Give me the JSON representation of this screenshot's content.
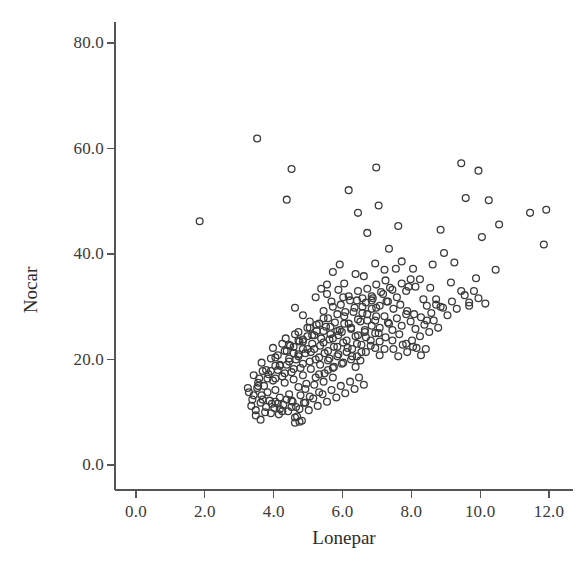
{
  "chart_data": {
    "type": "scatter",
    "title": "",
    "xlabel": "Lonepar",
    "ylabel": "Nocar",
    "xlim": [
      0.0,
      12.7
    ],
    "ylim": [
      0.0,
      84.0
    ],
    "xticks": [
      0.0,
      2.0,
      4.0,
      6.0,
      8.0,
      10.0,
      12.0
    ],
    "xtick_labels": [
      "0.0",
      "2.0",
      "4.0",
      "6.0",
      "8.0",
      "10.0",
      "12.0"
    ],
    "yticks": [
      0.0,
      20.0,
      40.0,
      60.0,
      80.0
    ],
    "ytick_labels": [
      "0.0",
      "20.0",
      "40.0",
      "60.0",
      "80.0"
    ],
    "grid": false,
    "legend": null,
    "marker": {
      "shape": "open-circle",
      "radius_px": 3.4,
      "stroke": "#3b3b3b",
      "stroke_width": 1.3,
      "fill": "none"
    },
    "axis_color": "#555555",
    "background": "#ffffff",
    "n_points": 330,
    "points": [
      [
        1.85,
        46.2
      ],
      [
        3.52,
        61.9
      ],
      [
        4.52,
        56.1
      ],
      [
        4.38,
        50.3
      ],
      [
        6.18,
        52.1
      ],
      [
        6.45,
        47.8
      ],
      [
        6.98,
        56.4
      ],
      [
        6.72,
        44.0
      ],
      [
        7.05,
        49.2
      ],
      [
        7.62,
        45.3
      ],
      [
        7.35,
        41.0
      ],
      [
        9.45,
        57.2
      ],
      [
        9.95,
        55.8
      ],
      [
        9.58,
        50.6
      ],
      [
        10.25,
        50.2
      ],
      [
        11.45,
        47.8
      ],
      [
        11.92,
        48.4
      ],
      [
        11.85,
        41.8
      ],
      [
        10.55,
        45.6
      ],
      [
        10.05,
        43.2
      ],
      [
        8.85,
        44.6
      ],
      [
        8.95,
        40.2
      ],
      [
        9.25,
        38.4
      ],
      [
        8.62,
        38.0
      ],
      [
        9.15,
        34.6
      ],
      [
        9.45,
        33.0
      ],
      [
        10.45,
        37.0
      ],
      [
        9.88,
        35.4
      ],
      [
        10.15,
        30.6
      ],
      [
        9.68,
        30.2
      ],
      [
        8.55,
        33.6
      ],
      [
        8.25,
        35.2
      ],
      [
        8.05,
        37.2
      ],
      [
        7.92,
        33.8
      ],
      [
        8.35,
        31.4
      ],
      [
        8.72,
        30.4
      ],
      [
        7.72,
        38.6
      ],
      [
        7.55,
        37.2
      ],
      [
        7.22,
        37.0
      ],
      [
        6.95,
        38.2
      ],
      [
        6.62,
        35.8
      ],
      [
        6.38,
        36.2
      ],
      [
        6.05,
        34.4
      ],
      [
        5.92,
        38.0
      ],
      [
        5.72,
        36.6
      ],
      [
        5.55,
        34.2
      ],
      [
        5.38,
        33.4
      ],
      [
        5.22,
        31.8
      ],
      [
        6.18,
        32.0
      ],
      [
        6.42,
        31.2
      ],
      [
        6.68,
        30.8
      ],
      [
        6.88,
        31.6
      ],
      [
        7.08,
        30.2
      ],
      [
        7.28,
        31.0
      ],
      [
        7.48,
        29.6
      ],
      [
        7.68,
        30.4
      ],
      [
        7.88,
        29.2
      ],
      [
        8.08,
        28.6
      ],
      [
        8.28,
        28.0
      ],
      [
        8.45,
        27.4
      ],
      [
        4.62,
        29.8
      ],
      [
        4.85,
        28.4
      ],
      [
        5.05,
        27.2
      ],
      [
        5.25,
        26.6
      ],
      [
        5.45,
        27.8
      ],
      [
        5.65,
        26.2
      ],
      [
        5.85,
        25.4
      ],
      [
        6.05,
        26.8
      ],
      [
        6.25,
        25.8
      ],
      [
        6.45,
        24.6
      ],
      [
        6.65,
        25.2
      ],
      [
        6.85,
        26.4
      ],
      [
        7.05,
        25.0
      ],
      [
        7.25,
        24.2
      ],
      [
        7.45,
        23.6
      ],
      [
        7.65,
        24.8
      ],
      [
        7.85,
        23.0
      ],
      [
        8.05,
        22.4
      ],
      [
        3.25,
        14.6
      ],
      [
        3.42,
        13.2
      ],
      [
        3.55,
        15.0
      ],
      [
        3.68,
        12.4
      ],
      [
        3.82,
        13.8
      ],
      [
        3.95,
        11.6
      ],
      [
        4.05,
        14.2
      ],
      [
        4.18,
        12.8
      ],
      [
        4.32,
        15.6
      ],
      [
        4.45,
        13.4
      ],
      [
        4.58,
        16.2
      ],
      [
        4.72,
        14.8
      ],
      [
        4.85,
        17.0
      ],
      [
        4.95,
        15.4
      ],
      [
        5.08,
        18.2
      ],
      [
        5.22,
        16.6
      ],
      [
        5.35,
        19.0
      ],
      [
        5.48,
        17.4
      ],
      [
        5.62,
        20.2
      ],
      [
        5.75,
        18.6
      ],
      [
        5.88,
        21.0
      ],
      [
        6.02,
        19.4
      ],
      [
        6.15,
        22.2
      ],
      [
        6.28,
        20.6
      ],
      [
        6.42,
        23.0
      ],
      [
        6.55,
        21.4
      ],
      [
        6.68,
        24.2
      ],
      [
        6.82,
        22.6
      ],
      [
        6.95,
        25.0
      ],
      [
        7.08,
        23.4
      ],
      [
        3.35,
        11.2
      ],
      [
        3.48,
        10.4
      ],
      [
        3.62,
        11.8
      ],
      [
        3.75,
        10.0
      ],
      [
        3.88,
        12.2
      ],
      [
        4.02,
        10.8
      ],
      [
        4.15,
        9.6
      ],
      [
        4.28,
        11.4
      ],
      [
        4.42,
        10.2
      ],
      [
        4.55,
        12.0
      ],
      [
        4.68,
        9.2
      ],
      [
        4.82,
        8.4
      ],
      [
        4.62,
        8.0
      ],
      [
        4.75,
        10.6
      ],
      [
        4.88,
        11.8
      ],
      [
        5.02,
        10.4
      ],
      [
        5.15,
        12.6
      ],
      [
        5.28,
        11.2
      ],
      [
        5.42,
        13.4
      ],
      [
        5.55,
        12.0
      ],
      [
        5.68,
        14.2
      ],
      [
        5.82,
        12.8
      ],
      [
        5.95,
        15.0
      ],
      [
        6.08,
        13.6
      ],
      [
        6.22,
        15.8
      ],
      [
        6.35,
        14.4
      ],
      [
        6.48,
        16.6
      ],
      [
        6.62,
        15.2
      ],
      [
        3.58,
        16.4
      ],
      [
        3.72,
        15.0
      ],
      [
        3.85,
        17.2
      ],
      [
        3.98,
        16.0
      ],
      [
        4.12,
        18.0
      ],
      [
        4.25,
        16.8
      ],
      [
        4.38,
        19.0
      ],
      [
        4.52,
        17.6
      ],
      [
        4.65,
        20.0
      ],
      [
        4.78,
        18.4
      ],
      [
        4.92,
        21.2
      ],
      [
        5.05,
        19.6
      ],
      [
        5.18,
        22.0
      ],
      [
        5.32,
        20.4
      ],
      [
        5.45,
        23.2
      ],
      [
        5.58,
        21.6
      ],
      [
        5.72,
        24.0
      ],
      [
        5.85,
        22.4
      ],
      [
        5.98,
        25.2
      ],
      [
        6.12,
        23.6
      ],
      [
        6.25,
        26.0
      ],
      [
        6.38,
        24.4
      ],
      [
        6.52,
        27.2
      ],
      [
        6.65,
        25.6
      ],
      [
        4.45,
        22.8
      ],
      [
        4.58,
        21.2
      ],
      [
        4.72,
        23.6
      ],
      [
        4.85,
        22.0
      ],
      [
        4.98,
        24.4
      ],
      [
        5.12,
        23.0
      ],
      [
        5.25,
        25.4
      ],
      [
        5.38,
        24.0
      ],
      [
        5.52,
        26.2
      ],
      [
        5.65,
        24.8
      ],
      [
        5.78,
        27.0
      ],
      [
        5.92,
        25.6
      ],
      [
        6.05,
        28.2
      ],
      [
        6.18,
        26.8
      ],
      [
        6.32,
        29.0
      ],
      [
        6.45,
        27.6
      ],
      [
        6.58,
        30.0
      ],
      [
        6.72,
        28.6
      ],
      [
        6.85,
        31.2
      ],
      [
        6.98,
        29.8
      ],
      [
        4.05,
        20.4
      ],
      [
        4.18,
        19.0
      ],
      [
        4.32,
        21.6
      ],
      [
        4.45,
        20.2
      ],
      [
        4.58,
        22.4
      ],
      [
        4.72,
        21.0
      ],
      [
        4.85,
        23.4
      ],
      [
        4.98,
        22.0
      ],
      [
        3.92,
        17.8
      ],
      [
        4.05,
        16.4
      ],
      [
        4.18,
        18.8
      ],
      [
        4.32,
        17.4
      ],
      [
        4.45,
        19.6
      ],
      [
        4.58,
        18.2
      ],
      [
        4.72,
        20.6
      ],
      [
        4.85,
        19.2
      ],
      [
        5.08,
        21.4
      ],
      [
        5.22,
        20.0
      ],
      [
        5.35,
        22.6
      ],
      [
        5.48,
        21.2
      ],
      [
        5.62,
        23.8
      ],
      [
        5.75,
        22.4
      ],
      [
        5.88,
        24.6
      ],
      [
        6.02,
        23.2
      ],
      [
        7.18,
        32.4
      ],
      [
        7.32,
        31.0
      ],
      [
        7.45,
        33.2
      ],
      [
        7.58,
        31.8
      ],
      [
        7.72,
        34.4
      ],
      [
        7.85,
        33.0
      ],
      [
        7.98,
        35.2
      ],
      [
        8.12,
        33.8
      ],
      [
        6.72,
        33.4
      ],
      [
        6.85,
        32.0
      ],
      [
        6.98,
        34.2
      ],
      [
        7.12,
        32.8
      ],
      [
        7.25,
        35.0
      ],
      [
        7.38,
        33.6
      ],
      [
        6.45,
        33.0
      ],
      [
        6.58,
        31.6
      ],
      [
        5.95,
        30.4
      ],
      [
        6.08,
        29.0
      ],
      [
        6.22,
        31.2
      ],
      [
        6.35,
        29.8
      ],
      [
        5.45,
        29.2
      ],
      [
        5.58,
        27.8
      ],
      [
        5.72,
        30.0
      ],
      [
        5.85,
        28.6
      ],
      [
        5.05,
        26.0
      ],
      [
        5.18,
        24.6
      ],
      [
        5.32,
        26.8
      ],
      [
        5.45,
        25.4
      ],
      [
        4.72,
        25.2
      ],
      [
        4.85,
        23.8
      ],
      [
        4.98,
        26.0
      ],
      [
        5.12,
        24.6
      ],
      [
        4.35,
        24.0
      ],
      [
        4.48,
        22.6
      ],
      [
        4.62,
        24.8
      ],
      [
        4.75,
        23.4
      ],
      [
        3.98,
        22.2
      ],
      [
        4.12,
        20.8
      ],
      [
        4.25,
        23.0
      ],
      [
        4.38,
        21.6
      ],
      [
        3.65,
        19.4
      ],
      [
        3.78,
        18.0
      ],
      [
        3.92,
        20.2
      ],
      [
        4.05,
        18.8
      ],
      [
        3.42,
        17.0
      ],
      [
        3.55,
        15.6
      ],
      [
        3.68,
        17.8
      ],
      [
        3.82,
        16.4
      ],
      [
        3.28,
        13.8
      ],
      [
        3.38,
        12.4
      ],
      [
        3.52,
        14.6
      ],
      [
        3.65,
        13.2
      ],
      [
        7.32,
        27.0
      ],
      [
        7.45,
        25.6
      ],
      [
        7.58,
        27.8
      ],
      [
        7.72,
        26.4
      ],
      [
        7.85,
        28.6
      ],
      [
        7.98,
        27.2
      ],
      [
        8.12,
        25.8
      ],
      [
        8.25,
        24.4
      ],
      [
        8.38,
        26.6
      ],
      [
        8.52,
        25.2
      ],
      [
        8.65,
        27.4
      ],
      [
        8.78,
        26.0
      ],
      [
        6.95,
        27.4
      ],
      [
        7.08,
        26.0
      ],
      [
        7.22,
        28.2
      ],
      [
        7.35,
        26.8
      ],
      [
        6.58,
        28.8
      ],
      [
        6.72,
        27.4
      ],
      [
        6.85,
        29.6
      ],
      [
        6.98,
        28.2
      ],
      [
        8.92,
        29.8
      ],
      [
        9.05,
        28.4
      ],
      [
        9.18,
        31.0
      ],
      [
        9.32,
        29.6
      ],
      [
        8.45,
        30.2
      ],
      [
        8.58,
        28.8
      ],
      [
        8.72,
        31.4
      ],
      [
        8.85,
        30.0
      ],
      [
        9.55,
        32.2
      ],
      [
        9.68,
        30.8
      ],
      [
        9.82,
        33.0
      ],
      [
        9.95,
        31.6
      ],
      [
        6.28,
        22.0
      ],
      [
        6.42,
        20.6
      ],
      [
        6.55,
        22.8
      ],
      [
        6.68,
        21.4
      ],
      [
        6.82,
        23.6
      ],
      [
        6.95,
        22.2
      ],
      [
        7.08,
        20.8
      ],
      [
        7.22,
        22.0
      ],
      [
        5.32,
        17.2
      ],
      [
        5.45,
        15.8
      ],
      [
        5.58,
        18.0
      ],
      [
        5.72,
        16.6
      ],
      [
        4.92,
        14.4
      ],
      [
        5.05,
        13.0
      ],
      [
        5.18,
        15.2
      ],
      [
        5.32,
        13.8
      ],
      [
        4.52,
        12.2
      ],
      [
        4.65,
        11.0
      ],
      [
        4.78,
        13.2
      ],
      [
        4.92,
        11.8
      ],
      [
        4.12,
        11.6
      ],
      [
        4.25,
        10.2
      ],
      [
        4.38,
        12.4
      ],
      [
        4.52,
        11.0
      ],
      [
        3.78,
        11.0
      ],
      [
        3.92,
        9.8
      ],
      [
        4.05,
        12.0
      ],
      [
        4.18,
        10.6
      ],
      [
        5.58,
        19.8
      ],
      [
        5.72,
        18.4
      ],
      [
        5.85,
        20.6
      ],
      [
        5.98,
        19.2
      ],
      [
        6.12,
        21.4
      ],
      [
        6.25,
        20.0
      ],
      [
        6.38,
        18.6
      ],
      [
        6.52,
        19.8
      ],
      [
        7.48,
        22.0
      ],
      [
        7.62,
        20.6
      ],
      [
        7.75,
        22.8
      ],
      [
        7.88,
        21.4
      ],
      [
        8.02,
        23.6
      ],
      [
        8.15,
        22.2
      ],
      [
        8.28,
        20.8
      ],
      [
        8.42,
        22.0
      ],
      [
        3.48,
        9.4
      ],
      [
        3.62,
        8.6
      ],
      [
        4.62,
        9.0
      ],
      [
        4.75,
        8.2
      ],
      [
        5.88,
        33.2
      ],
      [
        6.02,
        31.8
      ],
      [
        5.55,
        32.4
      ],
      [
        5.68,
        31.0
      ]
    ]
  }
}
